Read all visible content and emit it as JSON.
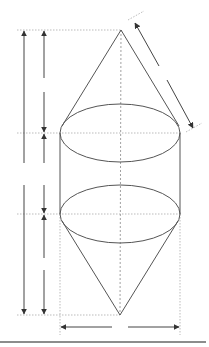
{
  "diagram": {
    "title": "",
    "colors": {
      "outline": "#555555",
      "dimension": "#444444",
      "guide": "#aaaaaa",
      "rule": "#8c8c8c"
    },
    "shapes": {
      "top_apex": [
        121,
        30
      ],
      "bottom_apex": [
        120,
        315
      ],
      "top_ellipse": {
        "cx": 120,
        "cy": 133,
        "rx": 60,
        "ry": 29
      },
      "bottom_ellipse": {
        "cx": 120,
        "cy": 214,
        "rx": 60,
        "ry": 29
      },
      "cylinder_left_x": 60,
      "cylinder_right_x": 180
    },
    "dimensions": [
      {
        "id": "total-height",
        "x": 24,
        "from": 30,
        "to": 315
      },
      {
        "id": "top-cone-height",
        "x": 44,
        "from": 30,
        "to": 133
      },
      {
        "id": "cylinder-height",
        "x": 44,
        "from": 133,
        "to": 214
      },
      {
        "id": "bottom-cone-height",
        "x": 44,
        "from": 214,
        "to": 315
      },
      {
        "id": "slant-height",
        "from": [
          135,
          23
        ],
        "to": [
          193,
          128
        ]
      },
      {
        "id": "diameter",
        "y": 327,
        "from": 60,
        "to": 180
      }
    ],
    "labels": []
  }
}
